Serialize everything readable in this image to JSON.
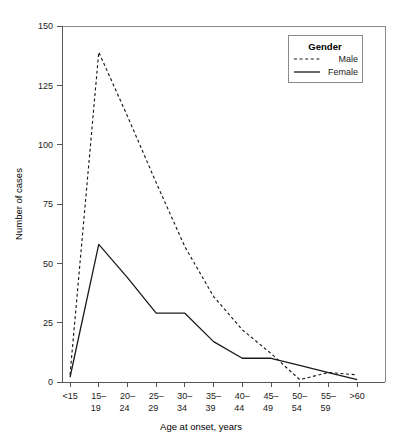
{
  "chart_data": {
    "type": "line",
    "title": "",
    "xlabel": "Age at onset, years",
    "ylabel": "Number of cases",
    "ylim": [
      0,
      150
    ],
    "yticks": [
      0,
      25,
      50,
      75,
      100,
      125,
      150
    ],
    "grid": false,
    "legend": {
      "title": "Gender",
      "position": "top-right",
      "entries": [
        {
          "name": "Male",
          "style": "dashed"
        },
        {
          "name": "Female",
          "style": "solid"
        }
      ]
    },
    "categories": [
      "<15",
      "15–19",
      "20–24",
      "25–29",
      "30–34",
      "35–39",
      "40–44",
      "45–49",
      "50–54",
      "55–59",
      ">60"
    ],
    "category_lines": [
      [
        "<15",
        ""
      ],
      [
        "15–",
        "19"
      ],
      [
        "20–",
        "24"
      ],
      [
        "25–",
        "29"
      ],
      [
        "30–",
        "34"
      ],
      [
        "35–",
        "39"
      ],
      [
        "40–",
        "44"
      ],
      [
        "45–",
        "49"
      ],
      [
        "50–",
        "54"
      ],
      [
        "55–",
        "59"
      ],
      [
        ">60",
        ""
      ]
    ],
    "series": [
      {
        "name": "Male",
        "style": "dashed",
        "values": [
          3,
          139,
          112,
          84,
          57,
          36,
          22,
          12,
          1,
          4,
          3
        ]
      },
      {
        "name": "Female",
        "style": "solid",
        "values": [
          2,
          58,
          44,
          29,
          29,
          17,
          10,
          10,
          7,
          4,
          1
        ]
      }
    ]
  },
  "colors": {
    "series_stroke": "#1a1a1a",
    "axis": "#555555",
    "frame": "#8a8a8a",
    "background": "#ffffff"
  }
}
